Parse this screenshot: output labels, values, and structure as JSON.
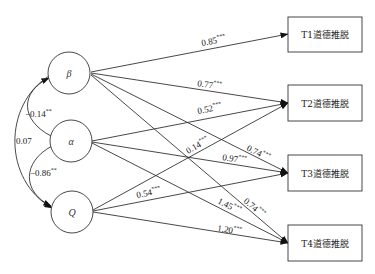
{
  "diagram": {
    "type": "path-model",
    "predictors": [
      {
        "id": "beta",
        "label": "β",
        "cx": 69,
        "cy": 73
      },
      {
        "id": "alpha",
        "label": "α",
        "cx": 71,
        "cy": 141
      },
      {
        "id": "q",
        "label": "Q",
        "cx": 72,
        "cy": 212
      }
    ],
    "outcomes": [
      {
        "id": "t1",
        "label": "T1道德推脱",
        "y": 17
      },
      {
        "id": "t2",
        "label": "T2道德推脱",
        "y": 85
      },
      {
        "id": "t3",
        "label": "T3道德推脱",
        "y": 155
      },
      {
        "id": "t4",
        "label": "T4道德推脱",
        "y": 225
      }
    ],
    "correlations": [
      {
        "from": "beta",
        "to": "alpha",
        "value": "−0.14",
        "sig": "**"
      },
      {
        "from": "alpha",
        "to": "q",
        "value": "−0.86",
        "sig": "**"
      },
      {
        "from": "beta",
        "to": "q",
        "value": "0.07",
        "sig": ""
      }
    ],
    "paths": [
      {
        "from": "beta",
        "to": "t1",
        "value": "0.85",
        "sig": "***"
      },
      {
        "from": "beta",
        "to": "t2",
        "value": "0.77",
        "sig": "***"
      },
      {
        "from": "beta",
        "to": "t3",
        "value": "0.74",
        "sig": "***"
      },
      {
        "from": "beta",
        "to": "t4",
        "value": "0.74",
        "sig": "***"
      },
      {
        "from": "alpha",
        "to": "t2",
        "value": "0.52",
        "sig": "***"
      },
      {
        "from": "alpha",
        "to": "t3",
        "value": "0.97",
        "sig": "***"
      },
      {
        "from": "alpha",
        "to": "t4",
        "value": "1.45",
        "sig": "***"
      },
      {
        "from": "q",
        "to": "t2",
        "value": "0.14",
        "sig": "***"
      },
      {
        "from": "q",
        "to": "t3",
        "value": "0.54",
        "sig": "***"
      },
      {
        "from": "q",
        "to": "t4",
        "value": "1.20",
        "sig": "***"
      }
    ]
  }
}
